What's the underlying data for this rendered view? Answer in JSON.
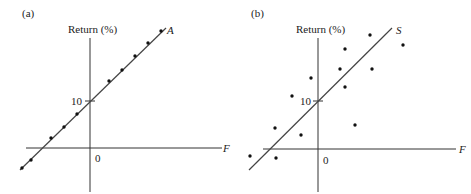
{
  "chart_data": [
    {
      "type": "scatter",
      "panel_label": "(a)",
      "title": "",
      "ylabel": "Return (%)",
      "xlabel": "F",
      "line_label": "A",
      "origin_label": "0",
      "y_tick_label": "10",
      "grid": false,
      "description": "Points lie exactly on a straight line with intercept 10",
      "points_px": [
        [
          22,
          168
        ],
        [
          31,
          160
        ],
        [
          51,
          138
        ],
        [
          64,
          127
        ],
        [
          77,
          114
        ],
        [
          109,
          81
        ],
        [
          122,
          70
        ],
        [
          135,
          56
        ],
        [
          148,
          43
        ],
        [
          161,
          31
        ]
      ],
      "line_px": [
        [
          20,
          170
        ],
        [
          166,
          28
        ]
      ]
    },
    {
      "type": "scatter",
      "panel_label": "(b)",
      "title": "",
      "ylabel": "Return (%)",
      "xlabel": "F",
      "line_label": "S",
      "origin_label": "0",
      "y_tick_label": "10",
      "grid": false,
      "description": "Points scattered around a straight line with intercept 10",
      "points_px": [
        [
          250,
          156
        ],
        [
          275,
          128
        ],
        [
          276,
          158
        ],
        [
          292,
          96
        ],
        [
          301,
          135
        ],
        [
          311,
          78
        ],
        [
          340,
          69
        ],
        [
          345,
          49
        ],
        [
          345,
          87
        ],
        [
          355,
          125
        ],
        [
          370,
          35
        ],
        [
          372,
          69
        ],
        [
          403,
          45
        ]
      ],
      "line_px": [
        [
          249,
          170
        ],
        [
          392,
          28
        ]
      ]
    }
  ],
  "colors": {
    "ink": "#222222",
    "background": "#ffffff"
  }
}
